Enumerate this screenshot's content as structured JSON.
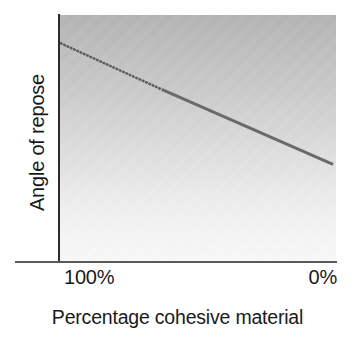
{
  "chart_data": {
    "type": "line",
    "title": "",
    "xlabel": "Percentage cohesive material",
    "ylabel": "Angle of repose",
    "xlim": [
      100,
      0
    ],
    "ylim": [
      0,
      100
    ],
    "grid": false,
    "legend": "none",
    "axis_note": "X axis runs from 100% on the left to 0% on the right; Y axis is unlabelled/qualitative.",
    "x_tick_labels": [
      "100%",
      "0%"
    ],
    "y_tick_labels": [],
    "series": [
      {
        "name": "Angle of repose vs percentage cohesive material",
        "style": "dotted-then-solid",
        "color": "#666666",
        "description": "Single straight line decreasing from upper-left to lower-right; extrapolated (dotted) at high cohesive-material percentages and measured (solid) at lower percentages.",
        "x": [
          100,
          63,
          0
        ],
        "y": [
          80,
          61,
          30
        ],
        "segments": [
          {
            "name": "extrapolated",
            "style": "dotted",
            "x_start": 100,
            "y_start": 80,
            "x_end": 63,
            "y_end": 61
          },
          {
            "name": "measured",
            "style": "solid",
            "x_start": 63,
            "y_start": 61,
            "x_end": 0,
            "y_end": 30
          }
        ]
      }
    ],
    "annotations": []
  },
  "axes": {
    "y_label": "Angle of repose",
    "x_title": "Percentage cohesive material",
    "x_tick_left": "100%",
    "x_tick_right": "0%"
  },
  "colors": {
    "line": "#666666",
    "axis_y": "#2b2b2b",
    "axis_x": "#5a5a5a",
    "panel_top": "#b2b2b2",
    "panel_bottom": "#f8f8f8",
    "text": "#1a1a1a"
  }
}
